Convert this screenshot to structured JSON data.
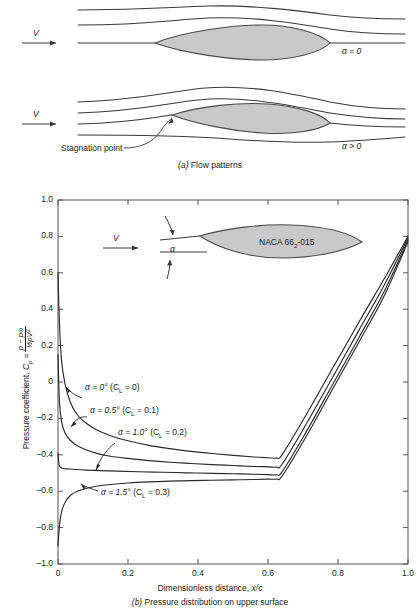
{
  "figure": {
    "panel_a": {
      "caption_marker": "(a)",
      "caption_text": "Flow patterns",
      "velocity_label": "V",
      "case_top_label": "α = 0",
      "case_bottom_label": "α > 0",
      "stagnation_label": "Stagnation point"
    },
    "panel_b": {
      "caption_marker": "(b)",
      "caption_text": "Pressure distribution on upper surface",
      "inset": {
        "velocity_label": "V",
        "angle_label": "α",
        "airfoil_name_prefix": "NACA 66",
        "airfoil_name_sub": "2",
        "airfoil_name_suffix": "-015"
      }
    }
  },
  "chart_data": {
    "type": "line",
    "title": "",
    "xlabel_text": "Dimensionless distance,",
    "xlabel_symbol": "x/c",
    "ylabel_prefix": "Pressure coefficient,",
    "ylabel_symbol": "C",
    "ylabel_symbol_sub": "p",
    "ylabel_equals": "=",
    "ylabel_numerator": "p − p∞",
    "ylabel_denominator": "½ρV²",
    "xlim": [
      0,
      1.0
    ],
    "ylim": [
      -1.0,
      1.0
    ],
    "y_inverted": true,
    "grid": false,
    "legend_position": "inline-annotations",
    "xticks": [
      0,
      0.2,
      0.4,
      0.6,
      0.8,
      1.0
    ],
    "xtick_labels": [
      "0",
      "0.2",
      "0.4",
      "0.6",
      "0.8",
      "1.0"
    ],
    "yticks": [
      1.0,
      0.8,
      0.6,
      0.4,
      0.2,
      0,
      -0.2,
      -0.4,
      -0.6,
      -0.8,
      -1.0
    ],
    "ytick_labels": [
      "1.0",
      "0.8",
      "0.6",
      "0.4",
      "0.2",
      "0",
      "–0.2",
      "–0.4",
      "–0.6",
      "–0.8",
      "–1.0"
    ],
    "series": [
      {
        "name": "alpha-0",
        "label_alpha": "α = 0°",
        "label_cl": "(C_L = 0)",
        "label_cl_prefix": "(C",
        "label_cl_sub": "L",
        "label_cl_suffix": " = 0)",
        "alpha_deg": 0,
        "cl": 0,
        "x": [
          0.0,
          0.004,
          0.01,
          0.02,
          0.035,
          0.055,
          0.08,
          0.11,
          0.15,
          0.2,
          0.26,
          0.32,
          0.38,
          0.44,
          0.5,
          0.56,
          0.6,
          0.625,
          0.64,
          0.7,
          0.78,
          0.86,
          0.93,
          1.0
        ],
        "y": [
          0.6,
          0.33,
          0.12,
          -0.01,
          -0.11,
          -0.18,
          -0.225,
          -0.262,
          -0.295,
          -0.323,
          -0.348,
          -0.366,
          -0.381,
          -0.393,
          -0.403,
          -0.412,
          -0.416,
          -0.418,
          -0.4,
          -0.21,
          0.06,
          0.33,
          0.56,
          0.8
        ]
      },
      {
        "name": "alpha-0p5",
        "label_alpha": "α = 0.5°",
        "label_cl": "(C_L = 0.1)",
        "label_cl_prefix": "(C",
        "label_cl_sub": "L",
        "label_cl_suffix": " = 0.1)",
        "alpha_deg": 0.5,
        "cl": 0.1,
        "x": [
          0.0,
          0.004,
          0.01,
          0.02,
          0.035,
          0.055,
          0.08,
          0.11,
          0.15,
          0.2,
          0.26,
          0.32,
          0.38,
          0.44,
          0.5,
          0.56,
          0.6,
          0.625,
          0.64,
          0.7,
          0.78,
          0.86,
          0.93,
          1.0
        ],
        "y": [
          0.15,
          -0.105,
          -0.215,
          -0.28,
          -0.32,
          -0.35,
          -0.372,
          -0.392,
          -0.408,
          -0.42,
          -0.432,
          -0.441,
          -0.448,
          -0.454,
          -0.459,
          -0.464,
          -0.466,
          -0.468,
          -0.452,
          -0.262,
          0.01,
          0.285,
          0.525,
          0.79
        ]
      },
      {
        "name": "alpha-1p0",
        "label_alpha": "α = 1.0°",
        "label_cl": "(C_L = 0.2)",
        "label_cl_prefix": "(C",
        "label_cl_sub": "L",
        "label_cl_suffix": " = 0.2)",
        "alpha_deg": 1.0,
        "cl": 0.2,
        "x": [
          0.0,
          0.003,
          0.008,
          0.016,
          0.03,
          0.05,
          0.08,
          0.12,
          0.17,
          0.23,
          0.3,
          0.37,
          0.44,
          0.5,
          0.56,
          0.6,
          0.625,
          0.64,
          0.7,
          0.78,
          0.86,
          0.93,
          1.0
        ],
        "y": [
          -0.39,
          -0.455,
          -0.47,
          -0.475,
          -0.478,
          -0.481,
          -0.484,
          -0.487,
          -0.49,
          -0.493,
          -0.496,
          -0.499,
          -0.502,
          -0.504,
          -0.507,
          -0.509,
          -0.51,
          -0.494,
          -0.305,
          -0.03,
          0.245,
          0.49,
          0.78
        ]
      },
      {
        "name": "alpha-1p5",
        "label_alpha": "α = 1.5°",
        "label_cl": "(C_L = 0.3)",
        "label_cl_prefix": "(C",
        "label_cl_sub": "L",
        "label_cl_suffix": " = 0.3)",
        "alpha_deg": 1.5,
        "cl": 0.3,
        "x": [
          0.0,
          0.002,
          0.006,
          0.012,
          0.022,
          0.036,
          0.055,
          0.08,
          0.11,
          0.15,
          0.2,
          0.26,
          0.32,
          0.38,
          0.44,
          0.5,
          0.56,
          0.6,
          0.625,
          0.64,
          0.7,
          0.78,
          0.86,
          0.93,
          1.0
        ],
        "y": [
          -0.9,
          -0.84,
          -0.76,
          -0.7,
          -0.655,
          -0.622,
          -0.6,
          -0.585,
          -0.573,
          -0.563,
          -0.555,
          -0.549,
          -0.545,
          -0.542,
          -0.54,
          -0.538,
          -0.536,
          -0.534,
          -0.533,
          -0.518,
          -0.33,
          -0.055,
          0.22,
          0.465,
          0.77
        ]
      }
    ]
  },
  "colors": {
    "ink": "#1a1a1a",
    "airfoil_fill": "#c9c9c9",
    "airfoil_stroke": "#4a4a4a",
    "axis": "#555555"
  }
}
